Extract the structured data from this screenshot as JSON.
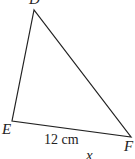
{
  "diagram": {
    "type": "triangle",
    "vertices": {
      "D": {
        "label": "D",
        "x": 34,
        "y": 10
      },
      "E": {
        "label": "E",
        "x": 12,
        "y": 121
      },
      "F": {
        "label": "F",
        "x": 131,
        "y": 137
      }
    },
    "sides": [
      {
        "from": "D",
        "to": "E"
      },
      {
        "from": "E",
        "to": "F",
        "label": "12 cm"
      },
      {
        "from": "D",
        "to": "F"
      }
    ],
    "extra_label": "x",
    "line_color": "#222222"
  }
}
